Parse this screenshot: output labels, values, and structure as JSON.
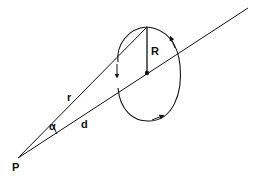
{
  "diagram": {
    "labels": {
      "point": "P",
      "slant_distance": "r",
      "axis_distance": "d",
      "angle": "α",
      "radius": "R"
    },
    "colors": {
      "stroke": "#111111",
      "background": "#ffffff"
    }
  }
}
